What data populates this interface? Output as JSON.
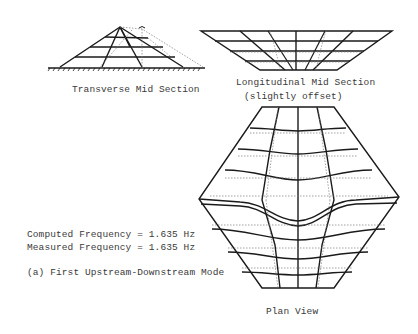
{
  "figure": {
    "caption": "(a) First Upstream-Downstream Mode",
    "frequencies": {
      "computed_label": "Computed Frequency = 1.635 Hz",
      "measured_label": "Measured Frequency = 1.635 Hz",
      "computed_value_hz": 1.635,
      "measured_value_hz": 1.635
    },
    "views": {
      "transverse": {
        "title": "Transverse Mid Section"
      },
      "longitudinal": {
        "title": "Longitudinal Mid Section",
        "subtitle": "(slightly offset)"
      },
      "plan": {
        "title": "Plan View"
      }
    },
    "legend": {
      "solid_line": "deformed mode shape",
      "dotted_line": "undeformed mesh"
    },
    "colors": {
      "ink": "#1a1a1a",
      "text": "#3a3a3a",
      "dotted": "#7a7a7a",
      "background": "#ffffff"
    }
  }
}
